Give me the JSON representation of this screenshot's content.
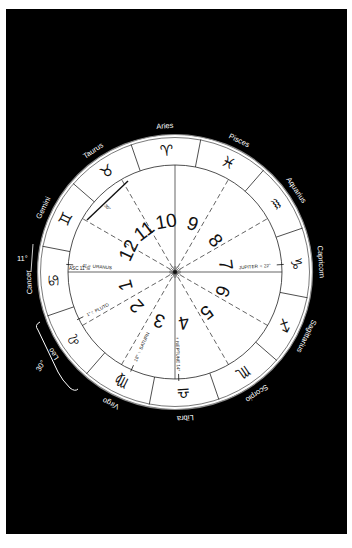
{
  "chart": {
    "center": [
      175,
      272
    ],
    "outer_radius": 136,
    "inner_radius": 107,
    "aries_zero_screen_angle": 281,
    "colors": {
      "background": "#000000",
      "wheel": "#ffffff",
      "ink": "#111111",
      "label": "#ffffff"
    }
  },
  "signs": [
    {
      "name": "Aries",
      "glyph": "♈︎"
    },
    {
      "name": "Taurus",
      "glyph": "♉︎"
    },
    {
      "name": "Gemini",
      "glyph": "♊︎"
    },
    {
      "name": "Cancer",
      "glyph": "♋︎"
    },
    {
      "name": "Leo",
      "glyph": "♌︎"
    },
    {
      "name": "Virgo",
      "glyph": "♍︎"
    },
    {
      "name": "Libra",
      "glyph": "♎︎"
    },
    {
      "name": "Scorpio",
      "glyph": "♏︎"
    },
    {
      "name": "Sagittarius",
      "glyph": "♐︎"
    },
    {
      "name": "Capricorn",
      "glyph": "♑︎"
    },
    {
      "name": "Aquarius",
      "glyph": "♒︎"
    },
    {
      "name": "Pisces",
      "glyph": "♓︎"
    }
  ],
  "houses": [
    {
      "number": "1",
      "angle": 165
    },
    {
      "number": "2",
      "angle": 138
    },
    {
      "number": "3",
      "angle": 108
    },
    {
      "number": "4",
      "angle": 80
    },
    {
      "number": "5",
      "angle": 52
    },
    {
      "number": "6",
      "angle": 22
    },
    {
      "number": "7",
      "angle": -8
    },
    {
      "number": "8",
      "angle": -38
    },
    {
      "number": "9",
      "angle": -70
    },
    {
      "number": "10",
      "angle": -100
    },
    {
      "number": "11",
      "angle": -127
    },
    {
      "number": "12",
      "angle": -155
    }
  ],
  "cusp_lines": {
    "solid": [
      0,
      90
    ],
    "dashed": [
      30,
      60,
      120,
      150
    ]
  },
  "ascendant": {
    "label": "ASC 11°♋︎"
  },
  "planets": [
    {
      "label": "4° ♅ URANUS",
      "angle": 184,
      "radius": 78
    },
    {
      "label": "JUPITER ♃ 22°",
      "angle": -4,
      "radius": 80
    },
    {
      "label": "1°♇ PLUTO",
      "angle": 154,
      "radius": 86
    },
    {
      "label": "18° ♄ SATURN",
      "angle": 114,
      "radius": 82
    },
    {
      "label": "♆ NEPTUNE 14°",
      "angle": 88,
      "radius": 82
    }
  ],
  "annotations": {
    "taurus_arc": "30°",
    "cancer_degree": "11°",
    "leo_bracket": "30°"
  }
}
